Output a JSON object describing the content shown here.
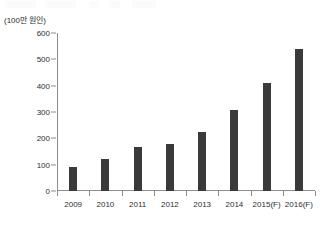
{
  "figure": {
    "unit_label": "(100만 원인)"
  },
  "chart_data": {
    "type": "bar",
    "title": "",
    "xlabel": "",
    "ylabel": "(100만 원인)",
    "categories": [
      "2009",
      "2010",
      "2011",
      "2012",
      "2013",
      "2014",
      "2015(F)",
      "2016(F)"
    ],
    "values": [
      90,
      120,
      168,
      180,
      225,
      307,
      410,
      540
    ],
    "ylim": [
      0,
      600
    ],
    "yticks": [
      0,
      100,
      200,
      300,
      400,
      500,
      600
    ],
    "ytick_labels": [
      "0",
      "100",
      "200",
      "300",
      "400",
      "500",
      "600"
    ],
    "grid": false,
    "legend": null,
    "bar_color": "#3a3a3a",
    "axis_color": "#8d8d8d"
  }
}
